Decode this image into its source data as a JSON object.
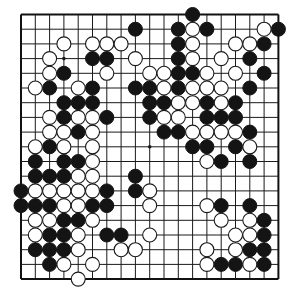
{
  "board": {
    "size": 19,
    "origin": {
      "x": 21,
      "y": 14.5
    },
    "spacing": {
      "x": 14.3,
      "y": 14.7
    },
    "stone_radius": 7,
    "colors": {
      "black": "#141414",
      "white": "#ffffff",
      "line": "#1a1a1a",
      "background": "#ffffff"
    },
    "star_points": [
      [
        3,
        3
      ],
      [
        9,
        9
      ]
    ],
    "stones": {
      "black": [
        [
          12,
          0
        ],
        [
          8,
          1
        ],
        [
          11,
          1
        ],
        [
          13,
          1
        ],
        [
          18,
          1
        ],
        [
          11,
          2
        ],
        [
          17,
          2
        ],
        [
          5,
          3
        ],
        [
          6,
          3
        ],
        [
          11,
          3
        ],
        [
          16,
          3
        ],
        [
          3,
          4
        ],
        [
          11,
          4
        ],
        [
          12,
          4
        ],
        [
          17,
          4
        ],
        [
          2,
          5
        ],
        [
          5,
          5
        ],
        [
          8,
          5
        ],
        [
          9,
          5
        ],
        [
          11,
          5
        ],
        [
          16,
          5
        ],
        [
          3,
          6
        ],
        [
          4,
          6
        ],
        [
          5,
          6
        ],
        [
          9,
          6
        ],
        [
          10,
          6
        ],
        [
          13,
          6
        ],
        [
          15,
          6
        ],
        [
          3,
          7
        ],
        [
          6,
          7
        ],
        [
          9,
          7
        ],
        [
          13,
          7
        ],
        [
          14,
          7
        ],
        [
          15,
          7
        ],
        [
          4,
          8
        ],
        [
          10,
          8
        ],
        [
          11,
          8
        ],
        [
          16,
          8
        ],
        [
          2,
          9
        ],
        [
          12,
          9
        ],
        [
          13,
          9
        ],
        [
          15,
          9
        ],
        [
          1,
          10
        ],
        [
          3,
          10
        ],
        [
          4,
          10
        ],
        [
          14,
          10
        ],
        [
          16,
          10
        ],
        [
          1,
          11
        ],
        [
          2,
          11
        ],
        [
          3,
          11
        ],
        [
          8,
          11
        ],
        [
          0,
          12
        ],
        [
          6,
          12
        ],
        [
          8,
          12
        ],
        [
          0,
          13
        ],
        [
          1,
          13
        ],
        [
          2,
          13
        ],
        [
          5,
          13
        ],
        [
          6,
          13
        ],
        [
          14,
          13
        ],
        [
          16,
          13
        ],
        [
          3,
          14
        ],
        [
          4,
          14
        ],
        [
          17,
          14
        ],
        [
          2,
          15
        ],
        [
          3,
          15
        ],
        [
          6,
          15
        ],
        [
          7,
          15
        ],
        [
          17,
          15
        ],
        [
          1,
          16
        ],
        [
          2,
          16
        ],
        [
          3,
          16
        ],
        [
          16,
          16
        ],
        [
          17,
          16
        ],
        [
          2,
          17
        ],
        [
          14,
          17
        ],
        [
          15,
          17
        ],
        [
          17,
          17
        ]
      ],
      "white": [
        [
          12,
          1
        ],
        [
          17,
          1
        ],
        [
          3,
          2
        ],
        [
          5,
          2
        ],
        [
          6,
          2
        ],
        [
          7,
          2
        ],
        [
          12,
          2
        ],
        [
          15,
          2
        ],
        [
          16,
          2
        ],
        [
          2,
          3
        ],
        [
          8,
          3
        ],
        [
          12,
          3
        ],
        [
          14,
          3
        ],
        [
          2,
          4
        ],
        [
          6,
          4
        ],
        [
          9,
          4
        ],
        [
          10,
          4
        ],
        [
          13,
          4
        ],
        [
          15,
          4
        ],
        [
          1,
          5
        ],
        [
          4,
          5
        ],
        [
          10,
          5
        ],
        [
          12,
          5
        ],
        [
          13,
          5
        ],
        [
          14,
          5
        ],
        [
          11,
          6
        ],
        [
          12,
          6
        ],
        [
          14,
          6
        ],
        [
          2,
          7
        ],
        [
          4,
          7
        ],
        [
          5,
          7
        ],
        [
          10,
          7
        ],
        [
          11,
          7
        ],
        [
          2,
          8
        ],
        [
          3,
          8
        ],
        [
          5,
          8
        ],
        [
          12,
          8
        ],
        [
          13,
          8
        ],
        [
          14,
          8
        ],
        [
          15,
          8
        ],
        [
          1,
          9
        ],
        [
          3,
          9
        ],
        [
          5,
          9
        ],
        [
          16,
          9
        ],
        [
          5,
          10
        ],
        [
          13,
          10
        ],
        [
          4,
          11
        ],
        [
          5,
          11
        ],
        [
          1,
          12
        ],
        [
          2,
          12
        ],
        [
          3,
          12
        ],
        [
          4,
          12
        ],
        [
          5,
          12
        ],
        [
          9,
          12
        ],
        [
          3,
          13
        ],
        [
          4,
          13
        ],
        [
          9,
          13
        ],
        [
          13,
          13
        ],
        [
          1,
          14
        ],
        [
          2,
          14
        ],
        [
          5,
          14
        ],
        [
          14,
          14
        ],
        [
          16,
          14
        ],
        [
          1,
          15
        ],
        [
          4,
          15
        ],
        [
          9,
          15
        ],
        [
          15,
          15
        ],
        [
          16,
          15
        ],
        [
          4,
          16
        ],
        [
          7,
          16
        ],
        [
          8,
          16
        ],
        [
          13,
          16
        ],
        [
          15,
          16
        ],
        [
          3,
          17
        ],
        [
          5,
          17
        ],
        [
          13,
          17
        ],
        [
          16,
          17
        ],
        [
          4,
          18
        ]
      ]
    }
  }
}
